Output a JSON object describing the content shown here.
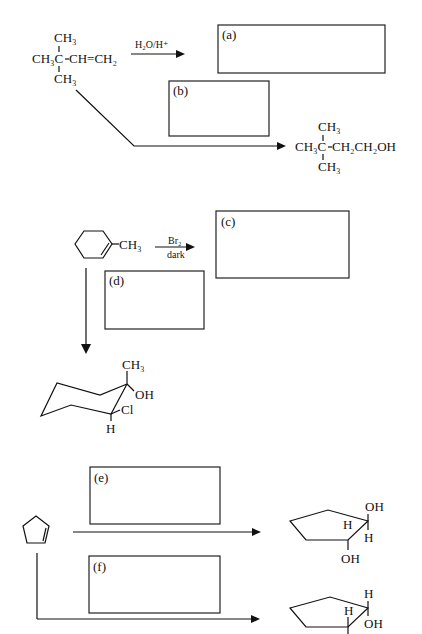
{
  "reaction1": {
    "reactant": {
      "top": "CH₃",
      "main_left": "CH₃C",
      "main_right": "CH=CH₂",
      "bottom": "CH₃"
    },
    "reagent": "H₂O/H⁺",
    "product": {
      "top": "CH₃",
      "main_left": "CH₃C",
      "main_right": "CH₂CH₂OH",
      "bottom": "CH₃"
    },
    "boxes": [
      {
        "label": "(a)"
      },
      {
        "label": "(b)"
      }
    ]
  },
  "reaction2": {
    "reactant_substituent": "CH₃",
    "reagent_top": "Br₂",
    "reagent_bottom": "dark",
    "boxes": [
      {
        "label": "(c)"
      },
      {
        "label": "(d)"
      }
    ],
    "product": {
      "methyl": "CH₃",
      "hydroxyl": "OH",
      "chloro": "Cl",
      "hydrogen": "H"
    }
  },
  "reaction3": {
    "boxes": [
      {
        "label": "(e)"
      },
      {
        "label": "(f)"
      }
    ],
    "product_e": {
      "oh_top": "OH",
      "h_top": "H",
      "h_inner": "H",
      "oh_bottom": "OH"
    },
    "product_f": {
      "h_top": "H",
      "h_inner": "H",
      "oh_bottom": "OH"
    }
  }
}
